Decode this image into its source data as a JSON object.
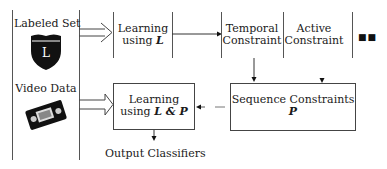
{
  "left_panel": {
    "labeled_set_label": "Labeled Set",
    "labeled_set_icon": "shield-icon",
    "labeled_set_icon_letter": "L",
    "video_data_label": "Video Data",
    "video_data_icon": "videotape-icon"
  },
  "top_row": {
    "learning_l": {
      "line1": "Learning",
      "line2_prefix": "using ",
      "line2_symbol": "L"
    },
    "temporal": {
      "line1": "Temporal",
      "line2": "Constraint"
    },
    "active": {
      "line1": "Active",
      "line2": "Constraint"
    },
    "ellipsis": "■■"
  },
  "bottom_row": {
    "learning_lp": {
      "line1": "Learning",
      "line2_prefix": "using ",
      "line2_symbol": "L & P"
    },
    "sequence": {
      "line1": "Sequence Constraints",
      "line2": "P"
    },
    "output_label": "Output Classifiers"
  },
  "colors": {
    "line": "#444444",
    "text": "#1a1a1a",
    "background": "#ffffff"
  }
}
